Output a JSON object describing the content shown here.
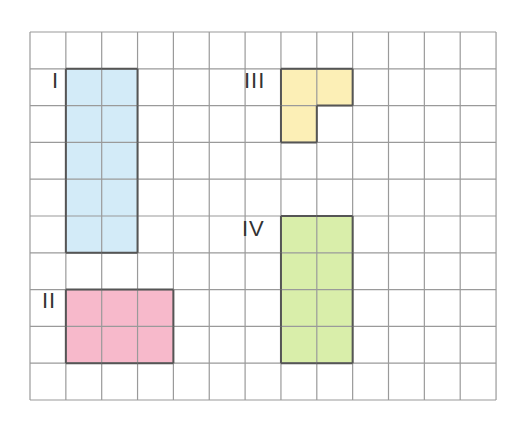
{
  "grid": {
    "left": 29,
    "top": 31,
    "cols": 13,
    "rows": 10,
    "cell_w": 35.85,
    "cell_h": 36.8,
    "line_color": "#9a9a9a",
    "border_color": "#555555"
  },
  "shapes": [
    {
      "id": "I",
      "label": "I",
      "fill": "#d3ebf8",
      "cells": [
        [
          1,
          1
        ],
        [
          2,
          1
        ],
        [
          1,
          2
        ],
        [
          2,
          2
        ],
        [
          1,
          3
        ],
        [
          2,
          3
        ],
        [
          1,
          4
        ],
        [
          2,
          4
        ],
        [
          1,
          5
        ],
        [
          2,
          5
        ]
      ],
      "label_pos": [
        52,
        70
      ]
    },
    {
      "id": "II",
      "label": "II",
      "fill": "#f7b9cb",
      "cells": [
        [
          1,
          7
        ],
        [
          2,
          7
        ],
        [
          3,
          7
        ],
        [
          1,
          8
        ],
        [
          2,
          8
        ],
        [
          3,
          8
        ]
      ],
      "label_pos": [
        42,
        290
      ]
    },
    {
      "id": "III",
      "label": "III",
      "fill": "#fcefb6",
      "cells": [
        [
          7,
          1
        ],
        [
          8,
          1
        ],
        [
          7,
          2
        ]
      ],
      "label_pos": [
        244,
        70
      ]
    },
    {
      "id": "IV",
      "label": "IV",
      "fill": "#d9eeaa",
      "cells": [
        [
          7,
          5
        ],
        [
          8,
          5
        ],
        [
          7,
          6
        ],
        [
          8,
          6
        ],
        [
          7,
          7
        ],
        [
          8,
          7
        ],
        [
          7,
          8
        ],
        [
          8,
          8
        ]
      ],
      "label_pos": [
        242,
        218
      ]
    }
  ]
}
